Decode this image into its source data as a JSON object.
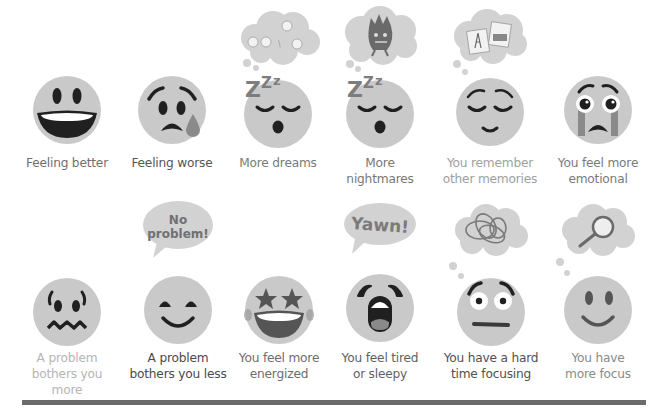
{
  "colors": {
    "face": "#c9c9c9",
    "feature": "#202020",
    "cloud": "#d2d2d2",
    "tear": "#8a8a8a",
    "bar": "#6b6b6b"
  },
  "row1": [
    {
      "label_lines": [
        "Feeling better"
      ],
      "label_color": "#6f6f6f",
      "icon": "grinning-face-icon"
    },
    {
      "label_lines": [
        "Feeling worse"
      ],
      "label_color": "#555555",
      "icon": "sad-sweat-face-icon"
    },
    {
      "label_lines": [
        "More dreams"
      ],
      "label_color": "#7a7a7a",
      "icon": "sleeping-sheep-dream-icon",
      "bubble": "sheep-thought-cloud"
    },
    {
      "label_lines": [
        "More",
        "nightmares"
      ],
      "label_color": "#777777",
      "icon": "sleeping-monster-dream-icon",
      "bubble": "monster-thought-cloud"
    },
    {
      "label_lines": [
        "You remember",
        "other memories"
      ],
      "label_color": "#a0a0a0",
      "icon": "content-memories-face-icon",
      "bubble": "photos-thought-cloud"
    },
    {
      "label_lines": [
        "You feel more",
        "emotional"
      ],
      "label_color": "#7a7a7a",
      "icon": "crying-face-icon"
    }
  ],
  "row2": [
    {
      "label_lines": [
        "A problem",
        "bothers you",
        "more"
      ],
      "label_color": "#b5b5b5",
      "icon": "anxious-face-icon"
    },
    {
      "label_lines": [
        "A problem",
        "bothers you less"
      ],
      "label_color": "#4a4a4a",
      "icon": "happy-face-icon",
      "bubble_text": [
        "No",
        "problem!"
      ]
    },
    {
      "label_lines": [
        "You feel more",
        "energized"
      ],
      "label_color": "#6d6d6d",
      "icon": "star-eyes-face-icon"
    },
    {
      "label_lines": [
        "You feel tired",
        "or sleepy"
      ],
      "label_color": "#5f5f5f",
      "icon": "yawning-face-icon",
      "bubble_text": [
        "Yawn!"
      ]
    },
    {
      "label_lines": [
        "You have a hard",
        "time focusing"
      ],
      "label_color": "#505050",
      "icon": "confused-face-icon",
      "bubble": "tangle-thought-cloud"
    },
    {
      "label_lines": [
        "You have",
        "more focus"
      ],
      "label_color": "#8a8a8a",
      "icon": "focused-smile-face-icon",
      "bubble": "magnifier-thought-cloud"
    }
  ]
}
